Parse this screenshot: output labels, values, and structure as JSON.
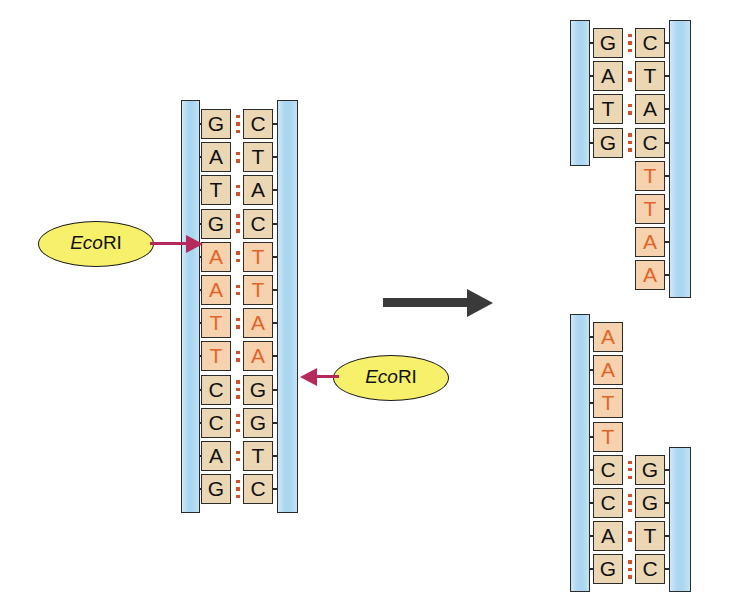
{
  "figure": {
    "accent_site_color": "#e2642a",
    "backbone_color": "#a9d6f0",
    "base_box_color": "#ecd7b4",
    "site_box_color": "#f6d2ae",
    "hbond_color": "#d4522a",
    "callout_fill": "#f7f06a",
    "callout_arrow_color": "#b5295c",
    "reaction_arrow_color": "#3a3a3a"
  },
  "enzyme": {
    "name_italic": "Eco",
    "name_upright": "RI",
    "full_name": "EcoRI"
  },
  "callouts": [
    {
      "label_italic": "Eco",
      "label_upright": "RI",
      "points": "right",
      "target": "top-strand-cut-between-G-and-A"
    },
    {
      "label_italic": "Eco",
      "label_upright": "RI",
      "points": "left",
      "target": "bottom-strand-cut-between-A-and-C"
    }
  ],
  "substrate": {
    "name": "intact-dna-duplex",
    "left_strand_label": "left strand",
    "right_strand_label": "right strand",
    "pairs": [
      {
        "left": "G",
        "right": "C",
        "bonds": 3,
        "site": false
      },
      {
        "left": "A",
        "right": "T",
        "bonds": 2,
        "site": false
      },
      {
        "left": "T",
        "right": "A",
        "bonds": 2,
        "site": false
      },
      {
        "left": "G",
        "right": "C",
        "bonds": 3,
        "site": false
      },
      {
        "left": "A",
        "right": "T",
        "bonds": 2,
        "site": true
      },
      {
        "left": "A",
        "right": "T",
        "bonds": 2,
        "site": true
      },
      {
        "left": "T",
        "right": "A",
        "bonds": 2,
        "site": true
      },
      {
        "left": "T",
        "right": "A",
        "bonds": 2,
        "site": true
      },
      {
        "left": "C",
        "right": "G",
        "bonds": 3,
        "site": false
      },
      {
        "left": "C",
        "right": "G",
        "bonds": 3,
        "site": false
      },
      {
        "left": "A",
        "right": "T",
        "bonds": 2,
        "site": false
      },
      {
        "left": "G",
        "right": "C",
        "bonds": 3,
        "site": false
      }
    ],
    "left_sequence": "GATGAATTCCAG",
    "right_sequence": "CTACTTAAGGTC",
    "recognition_sequence": "GAATTC"
  },
  "products": {
    "top_fragment": {
      "name": "upper-dna-fragment",
      "rows": [
        {
          "left": "G",
          "right": "C",
          "bonds": 3,
          "site": false,
          "paired": true
        },
        {
          "left": "A",
          "right": "T",
          "bonds": 2,
          "site": false,
          "paired": true
        },
        {
          "left": "T",
          "right": "A",
          "bonds": 2,
          "site": false,
          "paired": true
        },
        {
          "left": "G",
          "right": "C",
          "bonds": 3,
          "site": false,
          "paired": true
        },
        {
          "left": "",
          "right": "T",
          "bonds": 0,
          "site": true,
          "paired": false
        },
        {
          "left": "",
          "right": "T",
          "bonds": 0,
          "site": true,
          "paired": false
        },
        {
          "left": "",
          "right": "A",
          "bonds": 0,
          "site": true,
          "paired": false
        },
        {
          "left": "",
          "right": "A",
          "bonds": 0,
          "site": true,
          "paired": false
        }
      ],
      "left_sequence": "GATG",
      "right_sequence": "CTACTTAA",
      "overhang": "TTAA",
      "overhang_type": "5-prime sticky end"
    },
    "bottom_fragment": {
      "name": "lower-dna-fragment",
      "rows": [
        {
          "left": "A",
          "right": "",
          "bonds": 0,
          "site": true,
          "paired": false
        },
        {
          "left": "A",
          "right": "",
          "bonds": 0,
          "site": true,
          "paired": false
        },
        {
          "left": "T",
          "right": "",
          "bonds": 0,
          "site": true,
          "paired": false
        },
        {
          "left": "T",
          "right": "",
          "bonds": 0,
          "site": true,
          "paired": false
        },
        {
          "left": "C",
          "right": "G",
          "bonds": 3,
          "site": false,
          "paired": true
        },
        {
          "left": "C",
          "right": "G",
          "bonds": 3,
          "site": false,
          "paired": true
        },
        {
          "left": "A",
          "right": "T",
          "bonds": 2,
          "site": false,
          "paired": true
        },
        {
          "left": "G",
          "right": "C",
          "bonds": 3,
          "site": false,
          "paired": true
        }
      ],
      "left_sequence": "AATTCCAG",
      "right_sequence": "GGTC",
      "overhang": "AATT",
      "overhang_type": "5-prime sticky end"
    }
  },
  "reaction_arrow": {
    "name": "reaction-arrow",
    "direction": "right"
  }
}
